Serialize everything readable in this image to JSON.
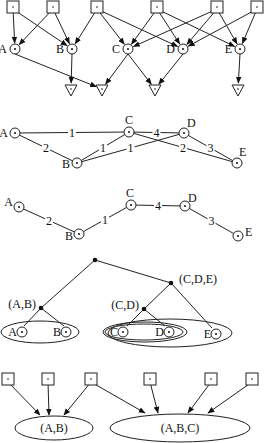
{
  "panels": {
    "dag": {
      "source_squares": [
        {
          "id": "s1",
          "x": 13,
          "y": 7
        },
        {
          "id": "s2",
          "x": 53,
          "y": 7
        },
        {
          "id": "s3",
          "x": 97,
          "y": 7
        },
        {
          "id": "s4",
          "x": 157,
          "y": 7
        },
        {
          "id": "s5",
          "x": 217,
          "y": 7
        },
        {
          "id": "s6",
          "x": 257,
          "y": 7
        }
      ],
      "variables": [
        {
          "id": "A",
          "label": "A",
          "x": 15,
          "y": 49
        },
        {
          "id": "B",
          "label": "B",
          "x": 72,
          "y": 49
        },
        {
          "id": "C",
          "label": "C",
          "x": 128,
          "y": 49
        },
        {
          "id": "D",
          "label": "D",
          "x": 183,
          "y": 49
        },
        {
          "id": "E",
          "label": "E",
          "x": 240,
          "y": 49
        }
      ],
      "sink_triangles": [
        {
          "id": "t1",
          "x": 71,
          "y": 90
        },
        {
          "id": "t2",
          "x": 102,
          "y": 90
        },
        {
          "id": "t3",
          "x": 155,
          "y": 90
        },
        {
          "id": "t4",
          "x": 238,
          "y": 90
        }
      ],
      "edges": [
        [
          "s1",
          "A"
        ],
        [
          "s1",
          "B"
        ],
        [
          "s2",
          "A"
        ],
        [
          "s2",
          "B"
        ],
        [
          "s3",
          "B"
        ],
        [
          "s3",
          "C"
        ],
        [
          "s3",
          "D"
        ],
        [
          "s4",
          "C"
        ],
        [
          "s4",
          "D"
        ],
        [
          "s4",
          "E"
        ],
        [
          "s5",
          "C"
        ],
        [
          "s5",
          "D"
        ],
        [
          "s5",
          "E"
        ],
        [
          "s6",
          "D"
        ],
        [
          "s6",
          "E"
        ],
        [
          "A",
          "t2"
        ],
        [
          "B",
          "t1"
        ],
        [
          "C",
          "t2"
        ],
        [
          "C",
          "t3"
        ],
        [
          "D",
          "t3"
        ],
        [
          "E",
          "t4"
        ]
      ]
    },
    "weighted_graph": {
      "nodes": [
        {
          "id": "A",
          "label": "A",
          "x": 15,
          "y": 133
        },
        {
          "id": "B",
          "label": "B",
          "x": 77,
          "y": 163
        },
        {
          "id": "C",
          "label": "C",
          "x": 129,
          "y": 132
        },
        {
          "id": "D",
          "label": "D",
          "x": 184,
          "y": 133
        },
        {
          "id": "E",
          "label": "E",
          "x": 237,
          "y": 163
        }
      ],
      "edges": [
        {
          "from": "A",
          "to": "C",
          "weight": "1"
        },
        {
          "from": "A",
          "to": "B",
          "weight": "2"
        },
        {
          "from": "B",
          "to": "C",
          "weight": "1"
        },
        {
          "from": "B",
          "to": "D",
          "weight": "1"
        },
        {
          "from": "C",
          "to": "D",
          "weight": "4"
        },
        {
          "from": "C",
          "to": "E",
          "weight": "2"
        },
        {
          "from": "D",
          "to": "E",
          "weight": "3"
        }
      ]
    },
    "spanning_tree": {
      "nodes": [
        {
          "id": "A",
          "label": "A",
          "x": 19,
          "y": 207
        },
        {
          "id": "B",
          "label": "B",
          "x": 79,
          "y": 234
        },
        {
          "id": "C",
          "label": "C",
          "x": 131,
          "y": 205
        },
        {
          "id": "D",
          "label": "D",
          "x": 185,
          "y": 206
        },
        {
          "id": "E",
          "label": "E",
          "x": 238,
          "y": 236
        }
      ],
      "edges": [
        {
          "from": "A",
          "to": "B",
          "weight": "2"
        },
        {
          "from": "B",
          "to": "C",
          "weight": "1"
        },
        {
          "from": "C",
          "to": "D",
          "weight": "4"
        },
        {
          "from": "D",
          "to": "E",
          "weight": "3"
        }
      ]
    },
    "hierarchy": {
      "root": {
        "x": 95,
        "y": 260
      },
      "internal": [
        {
          "id": "AB",
          "label": "(A,B)",
          "x": 41,
          "y": 308
        },
        {
          "id": "CDE",
          "label": "(C,D,E)",
          "x": 171,
          "y": 283
        },
        {
          "id": "CD",
          "label": "(C,D)",
          "x": 144,
          "y": 309
        }
      ],
      "leaves": [
        {
          "id": "A",
          "label": "A",
          "x": 22,
          "y": 332
        },
        {
          "id": "B",
          "label": "B",
          "x": 66,
          "y": 332
        },
        {
          "id": "C",
          "label": "C",
          "x": 123,
          "y": 332
        },
        {
          "id": "D",
          "label": "D",
          "x": 169,
          "y": 332
        },
        {
          "id": "E",
          "label": "E",
          "x": 216,
          "y": 334
        }
      ]
    },
    "cluster_model": {
      "source_squares": [
        {
          "id": "q1",
          "x": 8,
          "y": 379
        },
        {
          "id": "q2",
          "x": 48,
          "y": 379
        },
        {
          "id": "q3",
          "x": 91,
          "y": 379
        },
        {
          "id": "q4",
          "x": 150,
          "y": 379
        },
        {
          "id": "q5",
          "x": 211,
          "y": 379
        },
        {
          "id": "q6",
          "x": 252,
          "y": 379
        }
      ],
      "clusters": [
        {
          "id": "c1",
          "label": "(A,B)",
          "x": 54,
          "y": 428,
          "rx": 39,
          "ry": 12
        },
        {
          "id": "c2",
          "label": "(A,B,C)",
          "x": 180,
          "y": 428,
          "rx": 70,
          "ry": 14
        }
      ]
    }
  }
}
